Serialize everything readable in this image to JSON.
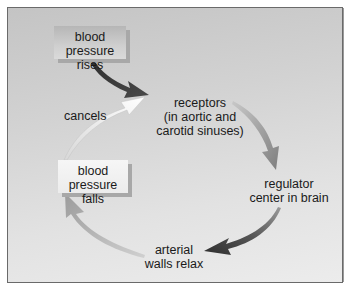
{
  "diagram": {
    "type": "feedback-cycle",
    "nodes": {
      "stimulus": "blood pressure rises",
      "stimulus_lines": [
        "blood",
        "pressure rises"
      ],
      "receptors_lines": [
        "receptors",
        "(in aortic and",
        "carotid sinuses)"
      ],
      "regulator_lines": [
        "regulator",
        "center in brain"
      ],
      "effector_lines": [
        "arterial",
        "walls relax"
      ],
      "response_lines": [
        "blood",
        "pressure falls"
      ],
      "feedback_label": "cancels"
    },
    "edges": [
      {
        "from": "blood pressure rises",
        "to": "receptors",
        "shade": "dark"
      },
      {
        "from": "receptors",
        "to": "regulator center in brain",
        "shade": "medium"
      },
      {
        "from": "regulator center in brain",
        "to": "arterial walls relax",
        "shade": "dark"
      },
      {
        "from": "arterial walls relax",
        "to": "blood pressure falls",
        "shade": "light"
      },
      {
        "from": "blood pressure falls",
        "to": "receptors",
        "shade": "white",
        "label": "cancels"
      }
    ],
    "colors": {
      "dark_arrow": "#3a3a3a",
      "medium_arrow": "#8a8a8a",
      "light_arrow": "#a6a6a6",
      "white_arrow": "#f8f8f8"
    }
  }
}
